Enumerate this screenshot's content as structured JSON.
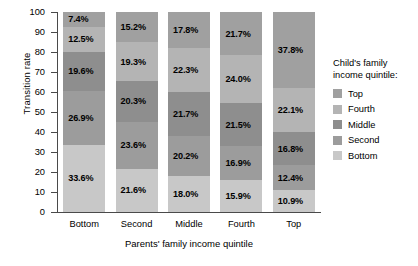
{
  "chart_data": {
    "type": "bar",
    "title": "",
    "xlabel": "Parents' family income quintile",
    "ylabel": "Transition rate",
    "ylim": [
      0,
      100
    ],
    "yticks": [
      0,
      10,
      20,
      30,
      40,
      50,
      60,
      70,
      80,
      90,
      100
    ],
    "grid": false,
    "stacked": true,
    "legend_position": "right",
    "legend_title": "Child's family income quintile:",
    "categories": [
      "Bottom",
      "Second",
      "Middle",
      "Fourth",
      "Top"
    ],
    "series": [
      {
        "name": "Top",
        "color": "#a0a0a0",
        "values": [
          7.4,
          15.2,
          17.8,
          21.7,
          37.8
        ],
        "labels": [
          "7.4%",
          "15.2%",
          "17.8%",
          "21.7%",
          "37.8%"
        ]
      },
      {
        "name": "Fourth",
        "color": "#b4b4b4",
        "values": [
          12.5,
          19.3,
          22.3,
          24.0,
          22.1
        ],
        "labels": [
          "12.5%",
          "19.3%",
          "22.3%",
          "24.0%",
          "22.1%"
        ]
      },
      {
        "name": "Middle",
        "color": "#8e8e8e",
        "values": [
          19.6,
          20.3,
          21.7,
          21.5,
          16.8
        ],
        "labels": [
          "19.6%",
          "20.3%",
          "21.7%",
          "21.5%",
          "16.8%"
        ]
      },
      {
        "name": "Second",
        "color": "#9c9c9c",
        "values": [
          26.9,
          23.6,
          20.2,
          16.9,
          12.4
        ],
        "labels": [
          "26.9%",
          "23.6%",
          "20.2%",
          "16.9%",
          "12.4%"
        ]
      },
      {
        "name": "Bottom",
        "color": "#c8c8c8",
        "values": [
          33.6,
          21.6,
          18.0,
          15.9,
          10.9
        ],
        "labels": [
          "33.6%",
          "21.6%",
          "18.0%",
          "15.9%",
          "10.9%"
        ]
      }
    ]
  },
  "axes": {
    "y_title": "Transition rate",
    "x_title": "Parents' family income quintile",
    "y_tick_labels": [
      "100",
      "90",
      "80",
      "70",
      "60",
      "50",
      "40",
      "30",
      "20",
      "10",
      "0"
    ],
    "x_tick_labels": [
      "Bottom",
      "Second",
      "Middle",
      "Fourth",
      "Top"
    ]
  },
  "legend": {
    "title_line1": "Child's family",
    "title_line2": "income quintile:",
    "items": [
      {
        "label": "Top",
        "color": "#a0a0a0"
      },
      {
        "label": "Fourth",
        "color": "#b4b4b4"
      },
      {
        "label": "Middle",
        "color": "#8e8e8e"
      },
      {
        "label": "Second",
        "color": "#9c9c9c"
      },
      {
        "label": "Bottom",
        "color": "#c8c8c8"
      }
    ]
  }
}
